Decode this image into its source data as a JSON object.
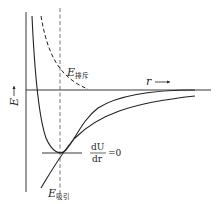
{
  "diagram": {
    "axes": {
      "y_label": "E",
      "x_label": "r"
    },
    "labels": {
      "repulsion_E": "E",
      "repulsion_sub": "排斥",
      "attraction_E": "E",
      "attraction_sub": "吸引",
      "deriv_num": "dU",
      "deriv_den": "dr",
      "deriv_eq": "=0"
    },
    "curves": [
      {
        "name": "repulsive energy",
        "style": "dashed"
      },
      {
        "name": "total potential",
        "style": "solid"
      },
      {
        "name": "attractive energy",
        "style": "solid"
      }
    ],
    "colors": {
      "line": "#222222",
      "background": "#ffffff"
    }
  }
}
